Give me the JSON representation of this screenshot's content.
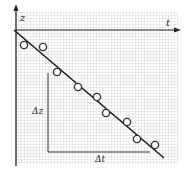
{
  "diagram": {
    "axes": {
      "vertical_label": "z",
      "horizontal_label": "t"
    },
    "annotations": {
      "delta_z": "Δz",
      "delta_t": "Δt"
    },
    "colors": {
      "background": "#ffffff",
      "grid": "#b8b8b8",
      "ink": "#222222"
    },
    "fit_line": {
      "x1": 14,
      "y1": 30,
      "x2": 164,
      "y2": 158
    },
    "points": [
      {
        "x": 24,
        "y": 45
      },
      {
        "x": 43,
        "y": 47
      },
      {
        "x": 57,
        "y": 72
      },
      {
        "x": 78,
        "y": 87
      },
      {
        "x": 97,
        "y": 97
      },
      {
        "x": 106,
        "y": 113
      },
      {
        "x": 127,
        "y": 122
      },
      {
        "x": 137,
        "y": 139
      },
      {
        "x": 155,
        "y": 145
      }
    ]
  }
}
